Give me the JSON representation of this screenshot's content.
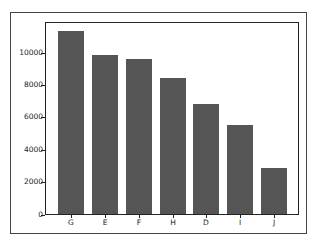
{
  "chart_data": {
    "type": "bar",
    "title": "",
    "xlabel": "",
    "ylabel": "",
    "categories": [
      "G",
      "E",
      "F",
      "H",
      "D",
      "I",
      "J"
    ],
    "values": [
      11350,
      9860,
      9600,
      8400,
      6840,
      5500,
      2890
    ],
    "ylim": [
      0,
      11900
    ],
    "yticks": [
      0,
      2000,
      4000,
      6000,
      8000,
      10000
    ],
    "ytick_labels": [
      "0",
      "2000",
      "4000",
      "6000",
      "8000",
      "10000"
    ],
    "grid": false,
    "legend": null,
    "bar_color": "#555555"
  }
}
